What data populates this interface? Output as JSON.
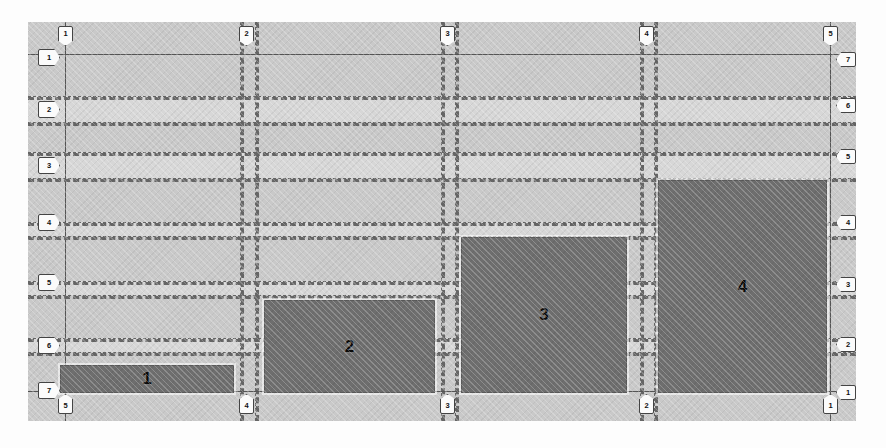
{
  "drawing": {
    "type": "structural-grid-plan",
    "canvas": {
      "x": 28,
      "y": 22,
      "width": 828,
      "height": 399,
      "fill": "#c9c9c9"
    },
    "zone_fill": "#6e6e6e",
    "gridline_color": "#555555",
    "dashed_gridline_color": "#666666"
  },
  "grid_labels": {
    "top": [
      "1",
      "2",
      "3",
      "4",
      "5"
    ],
    "bottom": [
      "5",
      "4",
      "3",
      "2",
      "1"
    ],
    "left": [
      "1",
      "2",
      "3",
      "4",
      "5",
      "6",
      "7"
    ],
    "right": [
      "7",
      "6",
      "5",
      "4",
      "3",
      "2",
      "1"
    ]
  },
  "chart_data": {
    "type": "bar",
    "title": "",
    "xlabel": "",
    "ylabel": "",
    "categories": [
      "1",
      "2",
      "3",
      "4"
    ],
    "values": [
      1,
      3.2,
      5.4,
      7.4
    ],
    "ylim": [
      0,
      14
    ],
    "grid": true,
    "legend": "none",
    "annotations": [
      "Bar labels are drawn inside each shaded zone",
      "Staircase / monotonically increasing profile"
    ]
  },
  "zones": [
    {
      "label": "1",
      "x": 60,
      "y": 365,
      "w": 172,
      "h": 26
    },
    {
      "label": "2",
      "x": 264,
      "y": 300,
      "w": 169,
      "h": 91
    },
    {
      "label": "3",
      "x": 461,
      "y": 237,
      "w": 164,
      "h": 154
    },
    {
      "label": "4",
      "x": 658,
      "y": 180,
      "w": 167,
      "h": 211
    }
  ],
  "vertical_lines": [
    {
      "x": 65,
      "style": "solid"
    },
    {
      "x": 240,
      "style": "dash"
    },
    {
      "x": 255,
      "style": "dash"
    },
    {
      "x": 441,
      "style": "dash"
    },
    {
      "x": 455,
      "style": "dash"
    },
    {
      "x": 640,
      "style": "dash"
    },
    {
      "x": 654,
      "style": "dash"
    },
    {
      "x": 830,
      "style": "solid"
    }
  ],
  "horizontal_lines": [
    {
      "y": 54,
      "style": "solid"
    },
    {
      "y": 96,
      "style": "dash"
    },
    {
      "y": 122,
      "style": "dash"
    },
    {
      "y": 152,
      "style": "dash"
    },
    {
      "y": 178,
      "style": "dash"
    },
    {
      "y": 222,
      "style": "dash"
    },
    {
      "y": 236,
      "style": "dash"
    },
    {
      "y": 281,
      "style": "dash"
    },
    {
      "y": 295,
      "style": "dash"
    },
    {
      "y": 338,
      "style": "dash"
    },
    {
      "y": 352,
      "style": "dash"
    },
    {
      "y": 391,
      "style": "solid"
    }
  ],
  "bands": [
    {
      "y": 96,
      "h": 26
    },
    {
      "y": 152,
      "h": 26
    },
    {
      "y": 222,
      "h": 14
    },
    {
      "y": 281,
      "h": 14
    },
    {
      "y": 338,
      "h": 14
    }
  ],
  "bubbles_top": [
    {
      "label": "1",
      "x": 65
    },
    {
      "label": "2",
      "x": 246
    },
    {
      "label": "3",
      "x": 447
    },
    {
      "label": "4",
      "x": 646
    },
    {
      "label": "5",
      "x": 830
    }
  ],
  "bubbles_bottom": [
    {
      "label": "5",
      "x": 65
    },
    {
      "label": "4",
      "x": 246
    },
    {
      "label": "3",
      "x": 447
    },
    {
      "label": "2",
      "x": 646
    },
    {
      "label": "1",
      "x": 830
    }
  ],
  "bubbles_left": [
    {
      "label": "1",
      "y": 56
    },
    {
      "label": "2",
      "y": 108
    },
    {
      "label": "3",
      "y": 164
    },
    {
      "label": "4",
      "y": 221
    },
    {
      "label": "5",
      "y": 281
    },
    {
      "label": "6",
      "y": 344
    },
    {
      "label": "7",
      "y": 389
    }
  ],
  "bubbles_right": [
    {
      "label": "7",
      "y": 59
    },
    {
      "label": "6",
      "y": 105
    },
    {
      "label": "5",
      "y": 156
    },
    {
      "label": "4",
      "y": 222
    },
    {
      "label": "3",
      "y": 284
    },
    {
      "label": "2",
      "y": 344
    },
    {
      "label": "1",
      "y": 392
    }
  ]
}
